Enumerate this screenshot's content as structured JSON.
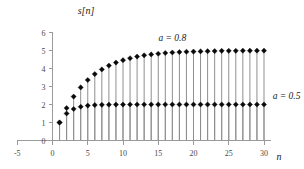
{
  "chart_data": {
    "type": "scatter",
    "plot_style": "stem",
    "title": "",
    "subtitle": "",
    "xlabel": "n",
    "ylabel": "s[n]",
    "xlim": [
      -5,
      31
    ],
    "ylim": [
      0,
      6
    ],
    "xticks": [
      -5,
      0,
      5,
      10,
      15,
      20,
      25,
      30
    ],
    "xtick_labels": [
      "-5",
      "0",
      "5",
      "10",
      "15",
      "20",
      "25",
      "30"
    ],
    "yticks": [
      0,
      1,
      2,
      3,
      4,
      5,
      6
    ],
    "ytick_labels": [
      "0",
      "1",
      "2",
      "3",
      "4",
      "5",
      "6"
    ],
    "grid": false,
    "legend_position": "inline-annotations",
    "x": [
      1,
      2,
      3,
      4,
      5,
      6,
      7,
      8,
      9,
      10,
      11,
      12,
      13,
      14,
      15,
      16,
      17,
      18,
      19,
      20,
      21,
      22,
      23,
      24,
      25,
      26,
      27,
      28,
      29,
      30
    ],
    "series": [
      {
        "name": "a = 0.8",
        "annotation": "a = 0.8",
        "annotation_x": 17,
        "annotation_y": 5.55,
        "marker": "diamond",
        "color": "#0a0a0a",
        "values": [
          1.0,
          1.8,
          2.44,
          2.95,
          3.36,
          3.69,
          3.95,
          4.16,
          4.33,
          4.46,
          4.57,
          4.66,
          4.73,
          4.78,
          4.82,
          4.86,
          4.89,
          4.91,
          4.93,
          4.94,
          4.95,
          4.96,
          4.97,
          4.98,
          4.98,
          4.98,
          4.99,
          4.99,
          4.99,
          4.99
        ]
      },
      {
        "name": "a = 0.5",
        "annotation": "a = 0.5",
        "annotation_x": 33.2,
        "annotation_y": 2.32,
        "marker": "diamond",
        "color": "#0a0a0a",
        "values": [
          1.0,
          1.5,
          1.75,
          1.875,
          1.938,
          1.969,
          1.984,
          1.992,
          1.996,
          1.998,
          1.999,
          2.0,
          2.0,
          2.0,
          2.0,
          2.0,
          2.0,
          2.0,
          2.0,
          2.0,
          2.0,
          2.0,
          2.0,
          2.0,
          2.0,
          2.0,
          2.0,
          2.0,
          2.0,
          2.0
        ]
      }
    ],
    "colors": {
      "marker": "#0a0a0a",
      "stem": "#8f8f8f",
      "axis": "#9a9a9a",
      "text": "#1a1a1a",
      "tick_text": "#4a4a4a",
      "background": "#ffffff"
    }
  }
}
